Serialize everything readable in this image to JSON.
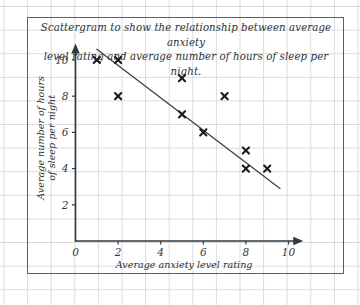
{
  "title": {
    "line1": "Scattergram to show the relationship between average anxiety",
    "line2": "level rating and average number of hours of sleep per night."
  },
  "colors": {
    "grid": "#d9dcdf",
    "border": "#5a5f63",
    "axis": "#33383c",
    "marker": "#1b1d1f",
    "trendline": "#3b3f42",
    "text": "#2e3133"
  },
  "chart_data": {
    "type": "scatter",
    "title": "Scattergram to show the relationship between average anxiety level rating and average number of hours of sleep per night.",
    "xlabel": "Average anxiety level rating",
    "ylabel_line1": "Average number of hours",
    "ylabel_line2": "of sleep per night",
    "xlim": [
      0,
      10.6
    ],
    "ylim": [
      0,
      10.8
    ],
    "xticks": [
      0,
      2,
      4,
      6,
      8,
      10
    ],
    "yticks": [
      2,
      4,
      6,
      8,
      10
    ],
    "xtick_labels": [
      "0",
      "2",
      "4",
      "6",
      "8",
      "10"
    ],
    "ytick_labels": [
      "2",
      "4",
      "6",
      "8",
      "10"
    ],
    "grid": true,
    "legend": false,
    "marker": "x",
    "points": [
      {
        "x": 1.0,
        "y": 10.0
      },
      {
        "x": 2.0,
        "y": 10.0
      },
      {
        "x": 2.0,
        "y": 8.0
      },
      {
        "x": 5.0,
        "y": 9.0
      },
      {
        "x": 5.0,
        "y": 7.0
      },
      {
        "x": 6.0,
        "y": 6.0
      },
      {
        "x": 7.0,
        "y": 8.0
      },
      {
        "x": 8.0,
        "y": 5.0
      },
      {
        "x": 8.0,
        "y": 4.0
      },
      {
        "x": 9.0,
        "y": 4.0
      }
    ],
    "trendline": {
      "label": "line of best fit",
      "x1": 1.0,
      "y1": 10.6,
      "x2": 9.6,
      "y2": 2.9
    }
  }
}
